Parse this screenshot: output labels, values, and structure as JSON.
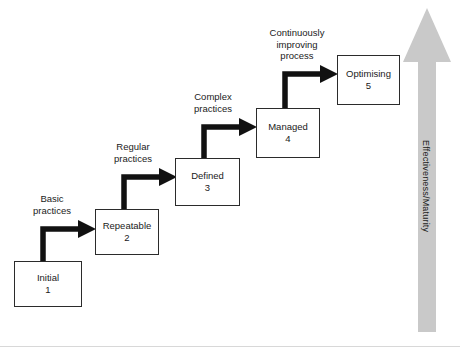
{
  "diagram": {
    "background_color": "#ffffff",
    "box_border_color": "#2b2b2b",
    "connector_color": "#111111",
    "maturity_arrow_color": "#c9c9c9",
    "stages": [
      {
        "name": "Initial",
        "level": "1"
      },
      {
        "name": "Repeatable",
        "level": "2"
      },
      {
        "name": "Defined",
        "level": "3"
      },
      {
        "name": "Managed",
        "level": "4"
      },
      {
        "name": "Optimising",
        "level": "5"
      }
    ],
    "transitions": [
      {
        "label": "Basic\npractices"
      },
      {
        "label": "Regular\npractices"
      },
      {
        "label": "Complex\npractices"
      },
      {
        "label": "Continuously\nimproving\nprocess"
      }
    ],
    "axis": {
      "label": "Effectiveness/Maturity",
      "direction": "up"
    }
  }
}
